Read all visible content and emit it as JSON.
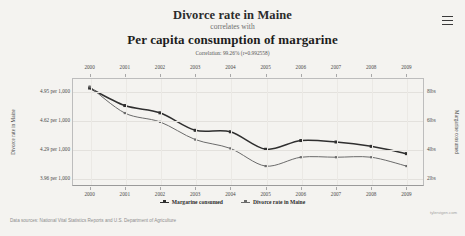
{
  "header": {
    "menu_icon": "hamburger-menu-icon"
  },
  "titles": {
    "title_top": "Divorce rate in Maine",
    "connector": "correlates with",
    "title_bottom": "Per capita consumption of margarine",
    "correlation": "Correlation: 99.26% (r=0.992558)"
  },
  "footer": {
    "source": "Data sources: National Vital Statistics Reports and U.S. Department of Agriculture",
    "brand": "tylervigen.com"
  },
  "axes": {
    "left_title": "Divorce rate in Maine",
    "right_title": "Margarine consumed",
    "left_ticks": [
      "4.95 per 1,000",
      "4.62 per 1,000",
      "4.29 per 1,000",
      "3.96 per 1,000"
    ],
    "right_ticks": [
      "8lbs",
      "6lbs",
      "4lbs",
      "2lbs"
    ]
  },
  "legend": {
    "position": "bottom-center",
    "items": [
      {
        "label": "Margarine consumed",
        "color": "#2f2f2f"
      },
      {
        "label": "Divorce rate in Maine",
        "color": "#6b6b6b"
      }
    ]
  },
  "chart_data": {
    "type": "line",
    "title": "Divorce rate in Maine correlates with Per capita consumption of margarine",
    "subtitle": "Correlation: 99.26% (r=0.992558)",
    "xlabel": "",
    "ylabel": "Divorce rate in Maine",
    "y2label": "Margarine consumed",
    "grid": true,
    "x": [
      2000,
      2001,
      2002,
      2003,
      2004,
      2005,
      2006,
      2007,
      2008,
      2009
    ],
    "categories": [
      "2000",
      "2001",
      "2002",
      "2003",
      "2004",
      "2005",
      "2006",
      "2007",
      "2008",
      "2009"
    ],
    "axis_top_ticks": [
      "2000",
      "2001",
      "2002",
      "2003",
      "2004",
      "2005",
      "2006",
      "2007",
      "2008",
      "2009"
    ],
    "axis_bottom_ticks": [
      "2000",
      "2001",
      "2002",
      "2003",
      "2004",
      "2005",
      "2006",
      "2007",
      "2008",
      "2009"
    ],
    "ylim": [
      3.96,
      5.0
    ],
    "y2lim": [
      2,
      8.4
    ],
    "yticks": [
      4.95,
      4.62,
      4.29,
      3.96
    ],
    "y2ticks": [
      8,
      6,
      4,
      2
    ],
    "series": [
      {
        "name": "Margarine consumed",
        "axis": "right",
        "unit": "lbs",
        "color": "#2f2f2f",
        "values": [
          8.2,
          7.0,
          6.5,
          5.3,
          5.2,
          4.0,
          4.6,
          4.5,
          4.2,
          3.7
        ]
      },
      {
        "name": "Divorce rate in Maine",
        "axis": "left",
        "unit": "per 1,000",
        "color": "#6b6b6b",
        "values": [
          5.0,
          4.7,
          4.6,
          4.4,
          4.3,
          4.1,
          4.2,
          4.2,
          4.2,
          4.1
        ]
      }
    ]
  }
}
